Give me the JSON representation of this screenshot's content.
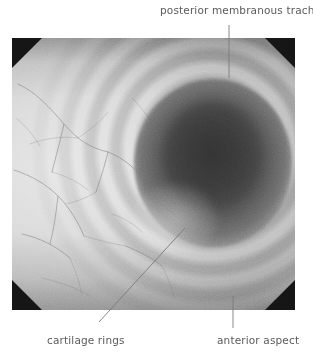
{
  "figure": {
    "name": "bronchoscopic-view-of-trachea",
    "modality": "endoscopy",
    "color_mode": "grayscale",
    "frame": {
      "x": 12,
      "y": 38,
      "width": 283,
      "height": 272,
      "corner_mask_color": "#161616",
      "corner_mask_size_px": 30
    },
    "content": {
      "lumen_center": {
        "x": 210,
        "y": 150
      },
      "mucosa_highlight": "left field",
      "vessel_color": "#6e6e72",
      "background_color": "#ffffff"
    }
  },
  "annotations": [
    {
      "id": "posterior-membranous-trachea",
      "label": "posterior membranous trachea",
      "position": "top",
      "leader": {
        "x1": 229,
        "y1": 25,
        "x2": 229,
        "y2": 78,
        "type": "vertical"
      }
    },
    {
      "id": "cartilage-rings",
      "label": "cartilage rings",
      "position": "bottom-left",
      "leader": {
        "x1": 99,
        "y1": 322,
        "x2": 185,
        "y2": 228,
        "type": "diagonal"
      }
    },
    {
      "id": "anterior-aspect",
      "label": "anterior aspect",
      "position": "bottom-right",
      "leader": {
        "x1": 233,
        "y1": 296,
        "x2": 233,
        "y2": 328,
        "type": "vertical"
      }
    }
  ],
  "style": {
    "leader_color": "#7b7b7e",
    "label_color": "#5b5b5d"
  }
}
